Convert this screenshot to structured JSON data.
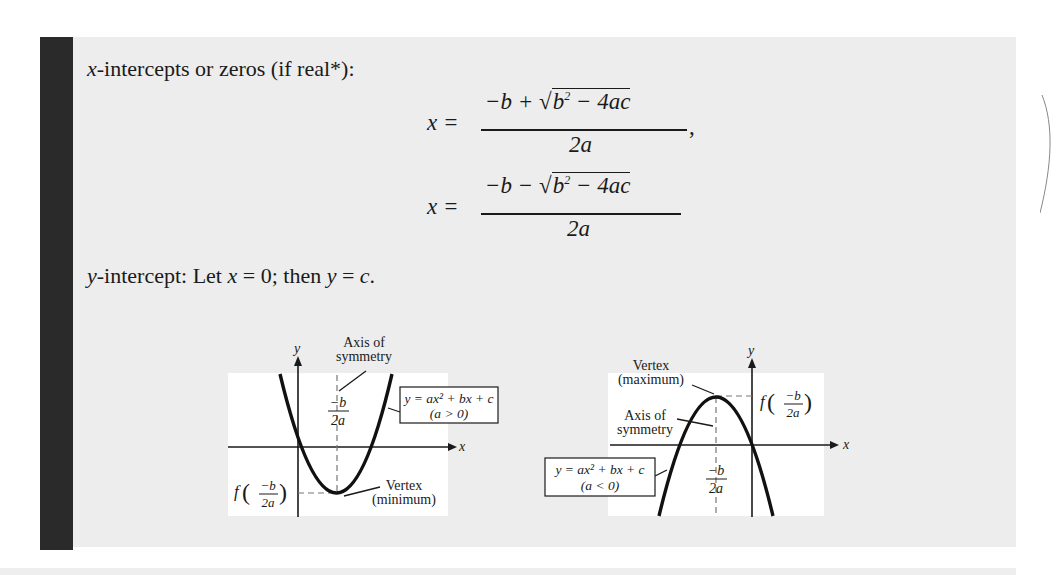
{
  "heading": {
    "var": "x",
    "text": "-intercepts or zeros (if real*):"
  },
  "formula_plus": {
    "lhs": "x =",
    "num_prefix": "−b + ",
    "radical": "b",
    "exp": "2",
    "radical_rest": " − 4ac",
    "den": "2a",
    "trail": ","
  },
  "formula_minus": {
    "lhs": "x =",
    "num_prefix": "−b − ",
    "radical": "b",
    "exp": "2",
    "radical_rest": " − 4ac",
    "den": "2a"
  },
  "y_intercept": {
    "var": "y",
    "text1": "-intercept: Let ",
    "xvar": "x",
    "text2": " = 0; then ",
    "yvar": "y",
    "text3": " = ",
    "cvar": "c",
    "text4": "."
  },
  "diagram_min": {
    "y_axis_label": "y",
    "x_axis_label": "x",
    "axis_label_line1": "Axis of",
    "axis_label_line2": "symmetry",
    "vertex_tick_num": "−b",
    "vertex_tick_den": "2a",
    "box_line1": "y = ax² + bx + c",
    "box_line2": "(a > 0)",
    "fvalue_f": "f",
    "fvalue_num": "−b",
    "fvalue_den": "2a",
    "vertex_label_line1": "Vertex",
    "vertex_label_line2": "(minimum)"
  },
  "diagram_max": {
    "y_axis_label": "y",
    "x_axis_label": "x",
    "vertex_label_line1": "Vertex",
    "vertex_label_line2": "(maximum)",
    "axis_label_line1": "Axis of",
    "axis_label_line2": "symmetry",
    "fvalue_f": "f",
    "fvalue_num": "−b",
    "fvalue_den": "2a",
    "box_line1": "y = ax² + bx + c",
    "box_line2": "(a < 0)",
    "vertex_tick_num": "−b",
    "vertex_tick_den": "2a"
  },
  "colors": {
    "panel": "#ededed",
    "bar": "#2a2a2a",
    "ink": "#1a1a1a"
  }
}
